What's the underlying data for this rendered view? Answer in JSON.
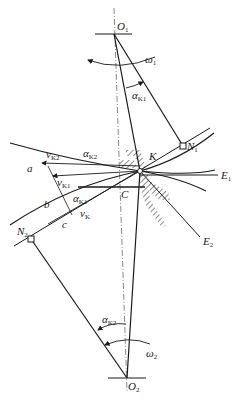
{
  "diagram": {
    "labels": {
      "O1": {
        "main": "O",
        "sub": "1"
      },
      "O2": {
        "main": "O",
        "sub": "2"
      },
      "omega1": {
        "main": "ω",
        "sub": "1"
      },
      "omega2": {
        "main": "ω",
        "sub": "2"
      },
      "alphaK1_top": {
        "main": "α",
        "sub": "K1"
      },
      "alphaK2_left": {
        "main": "α",
        "sub": "K2"
      },
      "alphaK1_mid": {
        "main": "α",
        "sub": "K1"
      },
      "alphaK2_bottom": {
        "main": "α",
        "sub": "K2"
      },
      "N1": {
        "main": "N",
        "sub": "1"
      },
      "N2": {
        "main": "N",
        "sub": "2"
      },
      "K": "K",
      "C": "C",
      "E1": {
        "main": "E",
        "sub": "1"
      },
      "E2": {
        "main": "E",
        "sub": "2"
      },
      "a": "a",
      "b": "b",
      "c": "c",
      "vK2": {
        "main": "v",
        "sub": "K2"
      },
      "vK1": {
        "main": "v",
        "sub": "K1"
      },
      "vK": {
        "main": "v",
        "sub": "K"
      }
    },
    "colors": {
      "line": "#1a1a1a",
      "centerline": "#555555",
      "background": "#ffffff"
    }
  }
}
